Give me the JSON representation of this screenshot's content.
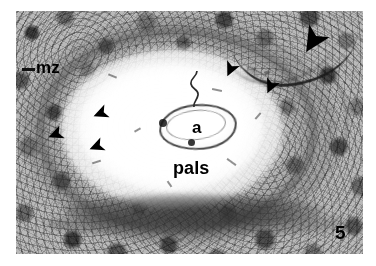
{
  "figure": {
    "number": "5",
    "domain": "light-microscopy histology micrograph",
    "background_color": "#ffffff",
    "plate": {
      "x": 16,
      "y": 11,
      "width": 347,
      "height": 243,
      "tone_light": "#f9f9f9",
      "tone_mid": "#b9b9b9",
      "tone_dark": "#2a2a2a"
    }
  },
  "labels": {
    "mz": {
      "text": "mz",
      "meaning": "marginal zone",
      "x": 36,
      "y": 59,
      "font_size": 17,
      "color": "#000000"
    },
    "a": {
      "text": "a",
      "meaning": "central arteriole",
      "x": 192,
      "y": 119,
      "font_size": 17,
      "color": "#000000"
    },
    "pals": {
      "text": "pals",
      "meaning": "periarteriolar lymphoid sheath",
      "x": 173,
      "y": 159,
      "font_size": 18,
      "color": "#000000"
    },
    "number": {
      "text": "5",
      "meaning": "figure number",
      "x": 335,
      "y": 223,
      "font_size": 19,
      "color": "#000000"
    }
  },
  "annotations": {
    "arrowheads": [
      {
        "name": "arrowhead-large-upper-right",
        "x": 300,
        "y": 28,
        "size": 26,
        "rotation": 215,
        "color": "#000000",
        "note": "large arrowhead marking the dark trabecular vessel"
      },
      {
        "name": "arrowhead-upper-right-1",
        "x": 226,
        "y": 64,
        "size": 14,
        "rotation": 200,
        "color": "#000000"
      },
      {
        "name": "arrowhead-upper-right-2",
        "x": 266,
        "y": 81,
        "size": 14,
        "rotation": 200,
        "color": "#000000"
      },
      {
        "name": "arrowhead-left-1",
        "x": 95,
        "y": 108,
        "size": 14,
        "rotation": 250,
        "color": "#000000"
      },
      {
        "name": "arrowhead-left-2",
        "x": 51,
        "y": 129,
        "size": 14,
        "rotation": 250,
        "color": "#000000"
      },
      {
        "name": "arrowhead-left-3",
        "x": 91,
        "y": 140,
        "size": 14,
        "rotation": 250,
        "color": "#000000"
      }
    ],
    "tick_marks": [
      {
        "name": "mz-leader-dash",
        "x": 22,
        "y": 68,
        "width": 13,
        "height": 3,
        "color": "#111111"
      }
    ]
  },
  "structures": [
    {
      "name": "pals-bright-zone",
      "shape": "ellipse",
      "x": 61,
      "y": 49,
      "width": 222,
      "height": 160,
      "tone": "near-white"
    },
    {
      "name": "marginal-zone-ring",
      "shape": "annulus",
      "x": 36,
      "y": 27,
      "width": 282,
      "height": 208,
      "tone": "mottled grey"
    },
    {
      "name": "central-arteriole",
      "shape": "ring",
      "x": 159,
      "y": 104,
      "width": 74,
      "height": 42,
      "tone": "dark outline"
    },
    {
      "name": "trabecular-vessel",
      "shape": "arc",
      "x": 230,
      "y": 31,
      "width": 130,
      "height": 52,
      "tone": "near-black"
    },
    {
      "name": "capsular-dark-band",
      "shape": "arc",
      "x": 64,
      "y": 194,
      "width": 260,
      "height": 34,
      "tone": "dark grey"
    }
  ]
}
